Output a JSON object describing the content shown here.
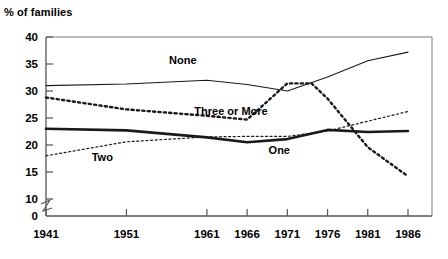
{
  "chart_data": {
    "type": "line",
    "title": "% of families",
    "xlabel": "",
    "ylabel": "% of families",
    "x": [
      1941,
      1946,
      1951,
      1956,
      1961,
      1966,
      1971,
      1976,
      1981,
      1986
    ],
    "xtick_labels": [
      "1941",
      "1951",
      "1961",
      "1966",
      "1971",
      "1976",
      "1981",
      "1986"
    ],
    "xtick_values": [
      1941,
      1951,
      1961,
      1966,
      1971,
      1976,
      1981,
      1986
    ],
    "ytick_labels": [
      "0",
      "10",
      "15",
      "20",
      "25",
      "30",
      "35",
      "40"
    ],
    "ytick_values": [
      0,
      10,
      15,
      20,
      25,
      30,
      35,
      40
    ],
    "ylim": [
      10,
      40
    ],
    "axis_break": true,
    "grid": false,
    "legend": "inline-labels",
    "series": [
      {
        "name": "None",
        "style": "thin-solid",
        "label_x": 1958,
        "label_y": 35.0,
        "points": [
          {
            "x": 1941,
            "y": 31.0
          },
          {
            "x": 1951,
            "y": 31.3
          },
          {
            "x": 1961,
            "y": 32.0
          },
          {
            "x": 1966,
            "y": 31.2
          },
          {
            "x": 1971,
            "y": 30.0
          },
          {
            "x": 1976,
            "y": 32.6
          },
          {
            "x": 1981,
            "y": 35.6
          },
          {
            "x": 1986,
            "y": 37.2
          }
        ]
      },
      {
        "name": "Three or More",
        "style": "bold-dotted",
        "label_x": 1964,
        "label_y": 25.6,
        "points": [
          {
            "x": 1941,
            "y": 28.8
          },
          {
            "x": 1951,
            "y": 26.6
          },
          {
            "x": 1961,
            "y": 25.4
          },
          {
            "x": 1966,
            "y": 24.7
          },
          {
            "x": 1971,
            "y": 31.4
          },
          {
            "x": 1974,
            "y": 31.4
          },
          {
            "x": 1976,
            "y": 28.6
          },
          {
            "x": 1981,
            "y": 19.6
          },
          {
            "x": 1986,
            "y": 14.2
          }
        ]
      },
      {
        "name": "One",
        "style": "thick-solid",
        "label_x": 1970,
        "label_y": 18.4,
        "points": [
          {
            "x": 1941,
            "y": 23.0
          },
          {
            "x": 1951,
            "y": 22.7
          },
          {
            "x": 1961,
            "y": 21.4
          },
          {
            "x": 1966,
            "y": 20.5
          },
          {
            "x": 1971,
            "y": 21.1
          },
          {
            "x": 1976,
            "y": 22.8
          },
          {
            "x": 1981,
            "y": 22.4
          },
          {
            "x": 1986,
            "y": 22.6
          }
        ]
      },
      {
        "name": "Two",
        "style": "thin-dotted",
        "label_x": 1948,
        "label_y": 17.0,
        "points": [
          {
            "x": 1941,
            "y": 18.0
          },
          {
            "x": 1951,
            "y": 20.6
          },
          {
            "x": 1961,
            "y": 21.5
          },
          {
            "x": 1966,
            "y": 21.6
          },
          {
            "x": 1971,
            "y": 21.6
          },
          {
            "x": 1976,
            "y": 22.6
          },
          {
            "x": 1981,
            "y": 24.4
          },
          {
            "x": 1986,
            "y": 26.2
          }
        ]
      }
    ]
  },
  "colors": {
    "axis": "#555555",
    "frame": "#777777",
    "line": "#1a1a1a",
    "text": "#000000",
    "background": "#ffffff"
  }
}
